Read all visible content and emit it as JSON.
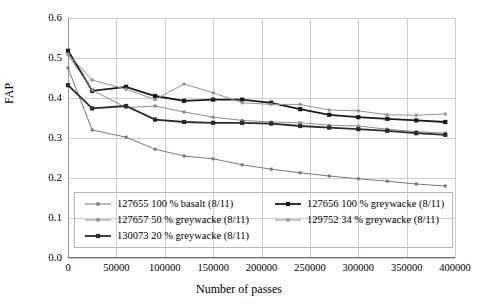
{
  "chart_data": {
    "type": "line",
    "title": "",
    "xlabel": "Number of passes",
    "ylabel": "FAP",
    "xlim": [
      0,
      400000
    ],
    "ylim": [
      0.0,
      0.6
    ],
    "xticks": [
      0,
      50000,
      100000,
      150000,
      200000,
      250000,
      300000,
      350000,
      400000
    ],
    "xtick_labels": [
      "0",
      "50000",
      "100000",
      "150000",
      "200000",
      "250000",
      "300000",
      "350000",
      "400000"
    ],
    "yticks": [
      0.0,
      0.1,
      0.2,
      0.3,
      0.4,
      0.5,
      0.6
    ],
    "ytick_labels": [
      "0.0",
      "0.1",
      "0.2",
      "0.3",
      "0.4",
      "0.5",
      "0.6"
    ],
    "grid": true,
    "legend_position": "lower-center-inside",
    "series": [
      {
        "name": "127655 100 % basalt (8/11)",
        "color": "#7a7a7a",
        "width": 1,
        "marker": "square-small",
        "x": [
          0,
          25000,
          60000,
          90000,
          120000,
          150000,
          180000,
          210000,
          240000,
          270000,
          300000,
          330000,
          360000,
          390000
        ],
        "y": [
          0.475,
          0.32,
          0.302,
          0.272,
          0.255,
          0.248,
          0.233,
          0.222,
          0.213,
          0.205,
          0.198,
          0.192,
          0.185,
          0.18
        ]
      },
      {
        "name": "127656 100 % greywacke (8/11)",
        "color": "#1a1a1a",
        "width": 1.8,
        "marker": "square",
        "x": [
          0,
          25000,
          60000,
          90000,
          120000,
          150000,
          180000,
          210000,
          240000,
          270000,
          300000,
          330000,
          360000,
          390000
        ],
        "y": [
          0.518,
          0.418,
          0.428,
          0.405,
          0.393,
          0.396,
          0.396,
          0.388,
          0.372,
          0.358,
          0.352,
          0.348,
          0.344,
          0.34
        ]
      },
      {
        "name": "127657 50 % greywacke (8/11)",
        "color": "#8d8d8d",
        "width": 1,
        "marker": "square-small",
        "x": [
          0,
          25000,
          60000,
          90000,
          120000,
          150000,
          180000,
          210000,
          240000,
          270000,
          300000,
          330000,
          360000,
          390000
        ],
        "y": [
          0.508,
          0.42,
          0.376,
          0.38,
          0.365,
          0.352,
          0.344,
          0.34,
          0.338,
          0.332,
          0.33,
          0.322,
          0.316,
          0.312
        ]
      },
      {
        "name": "129752 34 % greywacke (8/11)",
        "color": "#949494",
        "width": 1,
        "marker": "square-small",
        "x": [
          0,
          25000,
          60000,
          90000,
          120000,
          150000,
          180000,
          210000,
          240000,
          270000,
          300000,
          330000,
          360000,
          390000
        ],
        "y": [
          0.51,
          0.445,
          0.422,
          0.396,
          0.435,
          0.413,
          0.388,
          0.384,
          0.384,
          0.37,
          0.368,
          0.358,
          0.357,
          0.36
        ]
      },
      {
        "name": "130073 20 % greywacke (8/11)",
        "color": "#2b2b2b",
        "width": 1.8,
        "marker": "square",
        "x": [
          0,
          25000,
          60000,
          90000,
          120000,
          150000,
          180000,
          210000,
          240000,
          270000,
          300000,
          330000,
          360000,
          390000
        ],
        "y": [
          0.432,
          0.374,
          0.38,
          0.346,
          0.34,
          0.338,
          0.338,
          0.336,
          0.33,
          0.326,
          0.322,
          0.318,
          0.312,
          0.308
        ]
      }
    ]
  },
  "legend": {
    "entries": [
      {
        "label": "127655 100 % basalt (8/11)",
        "color": "#7a7a7a",
        "bold": false,
        "col": 0,
        "row": 0
      },
      {
        "label": "127656 100 % greywacke (8/11)",
        "color": "#1a1a1a",
        "bold": true,
        "col": 1,
        "row": 0
      },
      {
        "label": "127657 50 % greywacke (8/11)",
        "color": "#8d8d8d",
        "bold": false,
        "col": 0,
        "row": 1
      },
      {
        "label": "129752 34 % greywacke (8/11)",
        "color": "#949494",
        "bold": false,
        "col": 1,
        "row": 1
      },
      {
        "label": "130073 20 % greywacke (8/11)",
        "color": "#2b2b2b",
        "bold": true,
        "col": 0,
        "row": 2
      }
    ]
  }
}
